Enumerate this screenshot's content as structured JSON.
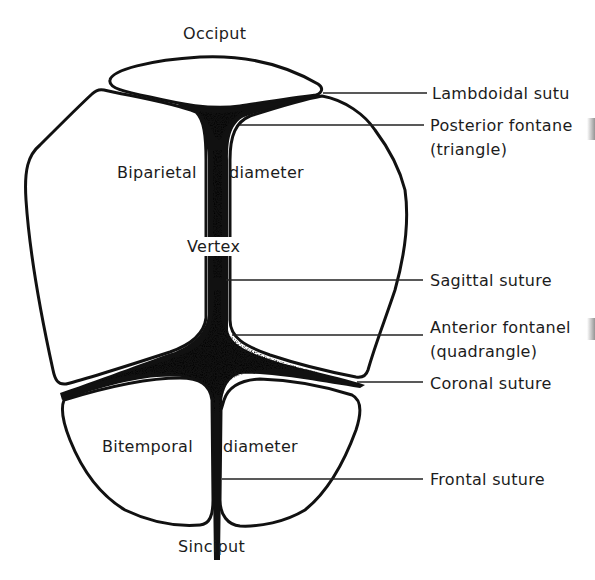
{
  "diagram": {
    "labels": {
      "top": "Occiput",
      "bottom": "Sinciput",
      "vertex": "Vertex",
      "biparietal_left": "Biparietal",
      "biparietal_right": "diameter",
      "bitemporal_left": "Bitemporal",
      "bitemporal_right": "diameter"
    },
    "callouts": [
      {
        "id": "lambdoidal",
        "line1": "Lambdoidal sutu",
        "line2": ""
      },
      {
        "id": "posterior-fontanel",
        "line1": "Posterior fontane",
        "line2": "(triangle)"
      },
      {
        "id": "sagittal",
        "line1": "Sagittal suture",
        "line2": ""
      },
      {
        "id": "anterior-fontanel",
        "line1": "Anterior fontanel",
        "line2": "(quadrangle)"
      },
      {
        "id": "coronal",
        "line1": "Coronal suture",
        "line2": ""
      },
      {
        "id": "frontal",
        "line1": "Frontal suture",
        "line2": ""
      }
    ],
    "colors": {
      "ink": "#111111",
      "background": "#ffffff",
      "text": "#1c1c1c"
    }
  }
}
